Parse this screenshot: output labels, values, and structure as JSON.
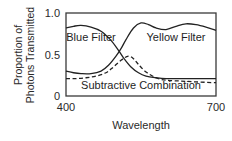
{
  "chart_data": {
    "type": "line",
    "title": "",
    "xlabel": "Wavelength",
    "ylabel_lines": [
      "Proportion of",
      "Photons Transmitted"
    ],
    "xlim": [
      400,
      700
    ],
    "ylim": [
      0,
      1.0
    ],
    "x_ticks": [
      {
        "value": 400,
        "label": "400"
      },
      {
        "value": 700,
        "label": "700"
      }
    ],
    "y_ticks": [
      {
        "value": 0,
        "label": "0"
      },
      {
        "value": 0.5,
        "label": "0.5"
      },
      {
        "value": 1.0,
        "label": "1.0"
      }
    ],
    "grid": false,
    "legend": "none",
    "series": [
      {
        "name": "Blue Filter",
        "style": "solid",
        "x": [
          400,
          415,
          430,
          450,
          470,
          490,
          505,
          515,
          530,
          545,
          560,
          580,
          600,
          650,
          700
        ],
        "y": [
          0.82,
          0.84,
          0.85,
          0.83,
          0.78,
          0.67,
          0.55,
          0.46,
          0.35,
          0.28,
          0.24,
          0.22,
          0.21,
          0.21,
          0.21
        ]
      },
      {
        "name": "Yellow Filter",
        "style": "solid",
        "x": [
          400,
          415,
          430,
          450,
          470,
          485,
          500,
          510,
          520,
          535,
          550,
          565,
          580,
          600,
          620,
          640,
          660,
          680,
          700
        ],
        "y": [
          0.3,
          0.28,
          0.27,
          0.27,
          0.3,
          0.37,
          0.48,
          0.57,
          0.68,
          0.82,
          0.88,
          0.86,
          0.82,
          0.8,
          0.84,
          0.87,
          0.86,
          0.83,
          0.79
        ]
      },
      {
        "name": "Subtractive Combination",
        "style": "dashed",
        "x": [
          400,
          420,
          440,
          460,
          480,
          495,
          510,
          520,
          527,
          535,
          545,
          560,
          580,
          600,
          630,
          660,
          700
        ],
        "y": [
          0.21,
          0.21,
          0.22,
          0.24,
          0.28,
          0.35,
          0.43,
          0.47,
          0.48,
          0.45,
          0.38,
          0.29,
          0.22,
          0.19,
          0.18,
          0.17,
          0.16
        ]
      }
    ],
    "annotations": [
      {
        "text": "Blue Filter",
        "x": 450,
        "y": 0.66
      },
      {
        "text": "Yellow Filter",
        "x": 620,
        "y": 0.66
      },
      {
        "text": "Subtractive Combination",
        "x": 550,
        "y": 0.09
      }
    ]
  }
}
